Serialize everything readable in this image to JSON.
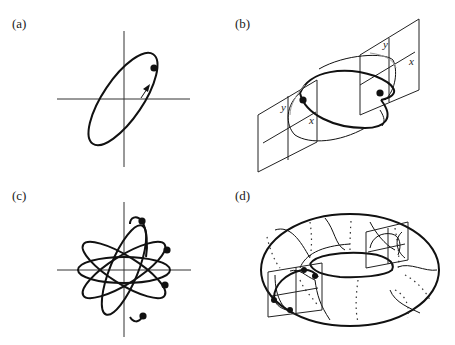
{
  "figure": {
    "panels": [
      {
        "id": "a",
        "label": "(a)",
        "description": "Tilted elliptical closed orbit in the x-y phase plane with a marked point and direction arrow"
      },
      {
        "id": "b",
        "label": "(b)",
        "description": "Orbit passing through two Poincare section planes, each with x and y axes and a marked intersection point"
      },
      {
        "id": "c",
        "label": "(c)",
        "description": "Multi-loop rosette orbit in the x-y plane with four marked points"
      },
      {
        "id": "d",
        "label": "(d)",
        "description": "Torus with a winding orbit crossing two section planes, with marked intersection points"
      }
    ],
    "axis_labels": {
      "x": "x",
      "y": "y"
    }
  }
}
